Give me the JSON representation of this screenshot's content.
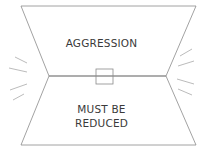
{
  "diagram": {
    "top_label": "AGGRESSION",
    "bottom_label_line1": "MUST BE",
    "bottom_label_line2": "REDUCED",
    "stroke_color": "#8a8a8a",
    "text_color": "#3a3a3a"
  }
}
